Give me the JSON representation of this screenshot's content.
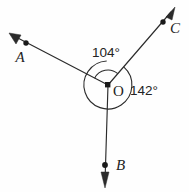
{
  "figure": {
    "background_color": "#fefefe",
    "stroke_color": "#2b2b2b",
    "width": 189,
    "height": 192
  },
  "vertex": {
    "name": "O",
    "label": "O",
    "x": 108,
    "y": 85
  },
  "rays": [
    {
      "id": "ray-a",
      "label": "A",
      "from_x": 108,
      "from_y": 85,
      "to_x": 11,
      "to_y": 35,
      "dot_x": 26,
      "dot_y": 43,
      "label_x": 20,
      "label_y": 62,
      "direction_deg": 153
    },
    {
      "id": "ray-c",
      "label": "C",
      "from_x": 108,
      "from_y": 85,
      "to_x": 174,
      "to_y": 9,
      "dot_x": 163,
      "dot_y": 22,
      "label_x": 170,
      "label_y": 33,
      "direction_deg": 49
    },
    {
      "id": "ray-b",
      "label": "B",
      "from_x": 108,
      "from_y": 85,
      "to_x": 105,
      "to_y": 186,
      "dot_x": 105,
      "dot_y": 165,
      "label_x": 116,
      "label_y": 170,
      "direction_deg": 269
    }
  ],
  "angles": [
    {
      "id": "angle-aoc",
      "value": 104,
      "label": "104°",
      "label_x": 92,
      "label_y": 57,
      "between": [
        "A",
        "C"
      ],
      "arc_radius": 15
    },
    {
      "id": "angle-cob",
      "value": 142,
      "label": "142°",
      "label_x": 130,
      "label_y": 95,
      "between": [
        "C",
        "B"
      ],
      "arc_radius": 24
    }
  ],
  "arrow": {
    "head_length": 9,
    "head_width": 5
  }
}
